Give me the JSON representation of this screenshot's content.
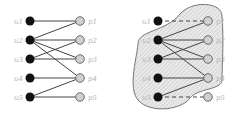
{
  "diagrams": [
    {
      "name": "bipartite-graph",
      "u_nodes": [
        {
          "label": "u1",
          "x": 30,
          "y": 21
        },
        {
          "label": "u2",
          "x": 30,
          "y": 40
        },
        {
          "label": "u3",
          "x": 30,
          "y": 59
        },
        {
          "label": "u4",
          "x": 30,
          "y": 78
        },
        {
          "label": "u5",
          "x": 30,
          "y": 97
        }
      ],
      "p_nodes": [
        {
          "label": "p1",
          "x": 80,
          "y": 21
        },
        {
          "label": "p2",
          "x": 80,
          "y": 40
        },
        {
          "label": "p3",
          "x": 80,
          "y": 59
        },
        {
          "label": "p4",
          "x": 80,
          "y": 78
        },
        {
          "label": "p5",
          "x": 80,
          "y": 97
        }
      ],
      "edges": [
        {
          "u": 0,
          "p": 0,
          "dashed": false
        },
        {
          "u": 1,
          "p": 0,
          "dashed": false
        },
        {
          "u": 1,
          "p": 1,
          "dashed": false
        },
        {
          "u": 1,
          "p": 2,
          "dashed": false
        },
        {
          "u": 1,
          "p": 3,
          "dashed": false
        },
        {
          "u": 2,
          "p": 1,
          "dashed": false
        },
        {
          "u": 2,
          "p": 2,
          "dashed": false
        },
        {
          "u": 3,
          "p": 3,
          "dashed": false
        },
        {
          "u": 4,
          "p": 3,
          "dashed": false
        },
        {
          "u": 4,
          "p": 4,
          "dashed": false
        }
      ],
      "region": null
    },
    {
      "name": "bipartite-graph-with-region",
      "u_nodes": [
        {
          "label": "u1",
          "x": 158,
          "y": 21
        },
        {
          "label": "u2",
          "x": 158,
          "y": 40
        },
        {
          "label": "u3",
          "x": 158,
          "y": 59
        },
        {
          "label": "u4",
          "x": 158,
          "y": 78
        },
        {
          "label": "u5",
          "x": 158,
          "y": 97
        }
      ],
      "p_nodes": [
        {
          "label": "p1",
          "x": 208,
          "y": 21
        },
        {
          "label": "p2",
          "x": 208,
          "y": 40
        },
        {
          "label": "p3",
          "x": 208,
          "y": 59
        },
        {
          "label": "p4",
          "x": 208,
          "y": 78
        },
        {
          "label": "p5",
          "x": 208,
          "y": 97
        }
      ],
      "edges": [
        {
          "u": 0,
          "p": 0,
          "dashed": true
        },
        {
          "u": 1,
          "p": 0,
          "dashed": false
        },
        {
          "u": 1,
          "p": 1,
          "dashed": false
        },
        {
          "u": 1,
          "p": 2,
          "dashed": false
        },
        {
          "u": 1,
          "p": 3,
          "dashed": false
        },
        {
          "u": 2,
          "p": 1,
          "dashed": false
        },
        {
          "u": 2,
          "p": 2,
          "dashed": false
        },
        {
          "u": 3,
          "p": 3,
          "dashed": false
        },
        {
          "u": 4,
          "p": 3,
          "dashed": false
        },
        {
          "u": 4,
          "p": 4,
          "dashed": true
        }
      ],
      "region": {
        "fill": "#e6e6e6",
        "stroke": "#555555",
        "hatched": true
      }
    }
  ],
  "colors": {
    "u_node_fill": "#111111",
    "p_node_fill": "#d0d0d0",
    "p_node_stroke": "#6a6a6a",
    "edge": "#444444",
    "label": "#b5b5b5"
  }
}
